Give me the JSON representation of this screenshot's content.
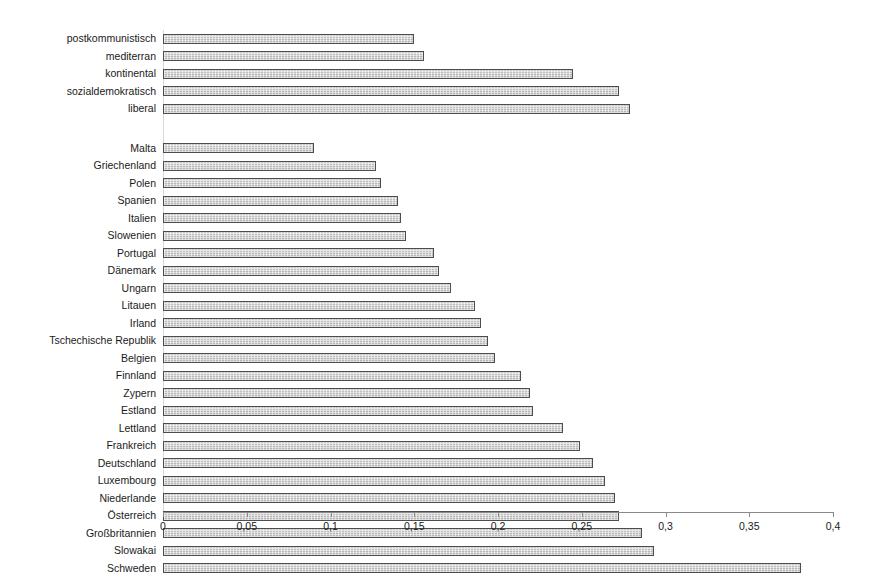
{
  "chart_data": {
    "type": "bar",
    "orientation": "horizontal",
    "title": "",
    "subtitle": "",
    "xlabel": "",
    "ylabel": "",
    "xlim": [
      0,
      0.4
    ],
    "xticks": [
      0,
      0.05,
      0.1,
      0.15,
      0.2,
      0.25,
      0.3,
      0.35,
      0.4
    ],
    "xtick_labels": [
      "0",
      "0,05",
      "0,1",
      "0,15",
      "0,2",
      "0,25",
      "0,3",
      "0,35",
      "0,4"
    ],
    "grid": false,
    "legend": "none",
    "decimal_separator": ",",
    "bar_face_color": "#c9c9c9",
    "bar_edge_color": "#4d4d4d",
    "axis_color": "#8a8a8a",
    "groups": [
      {
        "name": "welfare-regime-types",
        "categories": [
          "postkommunistisch",
          "mediterran",
          "kontinental",
          "sozialdemokratisch",
          "liberal"
        ],
        "values": [
          0.15,
          0.156,
          0.245,
          0.272,
          0.279
        ]
      },
      {
        "name": "countries",
        "categories": [
          "Malta",
          "Griechenland",
          "Polen",
          "Spanien",
          "Italien",
          "Slowenien",
          "Portugal",
          "Dänemark",
          "Ungarn",
          "Litauen",
          "Irland",
          "Tschechische Republik",
          "Belgien",
          "Finnland",
          "Zypern",
          "Estland",
          "Lettland",
          "Frankreich",
          "Deutschland",
          "Luxembourg",
          "Niederlande",
          "Österreich",
          "Großbritannien",
          "Slowakai",
          "Schweden"
        ],
        "values": [
          0.09,
          0.127,
          0.13,
          0.14,
          0.142,
          0.145,
          0.162,
          0.165,
          0.172,
          0.186,
          0.19,
          0.194,
          0.198,
          0.214,
          0.219,
          0.221,
          0.239,
          0.249,
          0.257,
          0.264,
          0.27,
          0.272,
          0.286,
          0.293,
          0.381
        ]
      }
    ]
  }
}
